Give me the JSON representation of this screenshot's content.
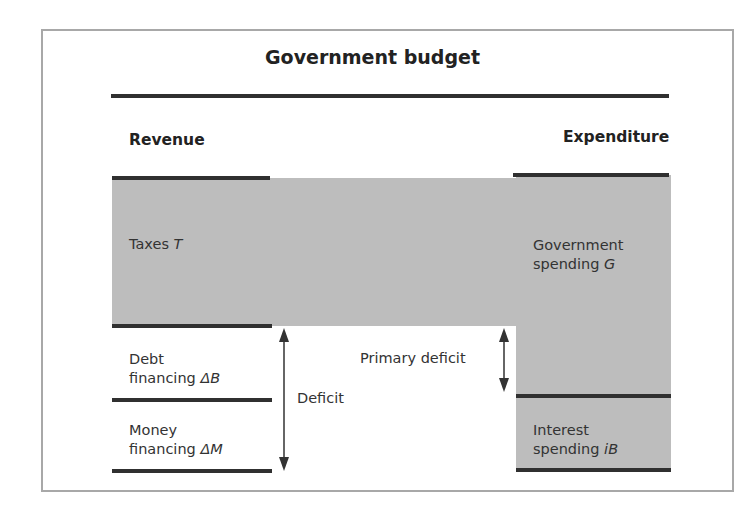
{
  "diagram": {
    "title": "Government budget",
    "columns": {
      "revenue": "Revenue",
      "expenditure": "Expenditure"
    },
    "revenue_items": [
      {
        "line1": "Taxes",
        "symbol": "T"
      },
      {
        "line1": "Debt",
        "line2": "financing",
        "symbol": "ΔB"
      },
      {
        "line1": "Money",
        "line2": "financing",
        "symbol": "ΔM"
      }
    ],
    "expenditure_items": [
      {
        "line1": "Government",
        "line2": "spending",
        "symbol": "G"
      },
      {
        "line1": "Interest",
        "line2": "spending",
        "symbol": "iB"
      }
    ],
    "arrows": {
      "deficit": "Deficit",
      "primary_deficit": "Primary deficit"
    },
    "colors": {
      "fill": "#bdbdbd",
      "rule": "#303030",
      "frame": "#a8a8a8"
    }
  }
}
